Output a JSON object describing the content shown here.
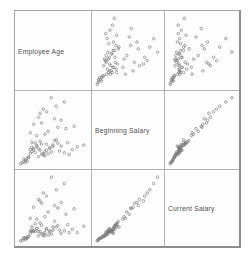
{
  "window": {
    "background": "#ffffff"
  },
  "labels": {
    "diagonal": [
      "Employee Age",
      "Beginning Salary",
      "Current Salary"
    ]
  },
  "chart_data": {
    "type": "scatter_matrix",
    "title": "",
    "grid": {
      "rows": 3,
      "cols": 3,
      "diagonal": "variable-labels",
      "tick_labels": "none",
      "border_color": "#a2a2a2",
      "inner_line_color": "#b2b2b2"
    },
    "variables": [
      {
        "key": "age",
        "label": "Employee Age"
      },
      {
        "key": "beginning_salary",
        "label": "Beginning Salary"
      },
      {
        "key": "current_salary",
        "label": "Current Salary"
      }
    ],
    "axis_ranges": {
      "age": [
        22,
        64
      ],
      "beginning_salary": [
        9,
        34
      ],
      "current_salary": [
        14,
        100
      ]
    },
    "marker": {
      "shape": "open-circle",
      "color": "#7a7a7a",
      "size_px": 2.6,
      "stroke_px": 0.75,
      "opacity": 0.9
    },
    "points": [
      [
        32,
        13.5,
        27
      ],
      [
        28,
        12,
        21
      ],
      [
        41,
        15,
        28
      ],
      [
        25,
        10.2,
        18
      ],
      [
        36,
        16.5,
        35
      ],
      [
        30,
        13.8,
        27
      ],
      [
        45,
        18,
        33
      ],
      [
        27,
        11.4,
        20
      ],
      [
        39,
        14.2,
        31
      ],
      [
        33,
        15.6,
        31
      ],
      [
        52,
        17,
        36
      ],
      [
        24,
        9.8,
        16
      ],
      [
        37,
        12.6,
        22
      ],
      [
        29,
        13.2,
        25
      ],
      [
        43,
        16.2,
        33
      ],
      [
        31,
        14.4,
        28
      ],
      [
        48,
        15.8,
        25
      ],
      [
        26,
        10.8,
        19
      ],
      [
        35,
        17.4,
        38
      ],
      [
        40,
        13,
        23
      ],
      [
        34,
        14.8,
        27
      ],
      [
        38,
        12.3,
        22
      ],
      [
        23,
        9.5,
        15.5
      ],
      [
        46,
        16.8,
        35
      ],
      [
        30,
        15.3,
        29
      ],
      [
        42,
        13.7,
        24
      ],
      [
        28,
        11.7,
        21
      ],
      [
        55,
        14.5,
        30
      ],
      [
        33,
        16,
        31
      ],
      [
        36,
        12.9,
        24
      ],
      [
        44,
        17.7,
        40
      ],
      [
        27,
        10.5,
        18.5
      ],
      [
        50,
        13.4,
        28
      ],
      [
        31,
        15,
        28
      ],
      [
        39,
        16.4,
        30
      ],
      [
        25,
        11.1,
        19.5
      ],
      [
        47,
        14,
        29
      ],
      [
        34,
        12,
        22
      ],
      [
        29,
        14.6,
        28
      ],
      [
        58,
        15.5,
        26
      ],
      [
        32,
        16.9,
        37
      ],
      [
        37,
        13.1,
        24.5
      ],
      [
        41,
        15.2,
        27
      ],
      [
        26,
        10,
        17
      ],
      [
        53,
        12.8,
        26
      ],
      [
        35,
        14.3,
        27
      ],
      [
        30,
        17.1,
        33
      ],
      [
        62,
        16.1,
        34
      ],
      [
        38,
        13.9,
        26
      ],
      [
        43,
        15.7,
        29
      ],
      [
        33,
        19.5,
        43
      ],
      [
        40,
        21,
        52
      ],
      [
        29,
        20.5,
        44
      ],
      [
        46,
        22.5,
        57
      ],
      [
        36,
        24,
        63
      ],
      [
        51,
        22,
        49
      ],
      [
        31,
        23.5,
        58
      ],
      [
        44,
        25.5,
        60
      ],
      [
        38,
        20,
        46
      ],
      [
        56,
        22.8,
        56
      ],
      [
        34,
        26,
        68
      ],
      [
        48,
        25,
        64
      ],
      [
        39,
        28,
        72
      ],
      [
        45,
        30,
        80
      ],
      [
        35,
        27.5,
        66
      ],
      [
        50,
        31.5,
        88
      ],
      [
        42,
        33,
        96
      ],
      [
        37,
        29,
        76
      ]
    ]
  }
}
